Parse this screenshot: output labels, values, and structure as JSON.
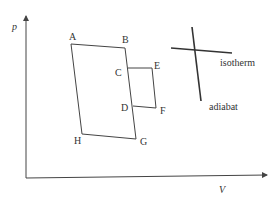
{
  "diagram": {
    "type": "pV-diagram",
    "axes": {
      "y_label": "p",
      "x_label": "V"
    },
    "points": {
      "A": "A",
      "B": "B",
      "C": "C",
      "D": "D",
      "E": "E",
      "F": "F",
      "G": "G",
      "H": "H"
    },
    "legend": {
      "isotherm": "isotherm",
      "adiabat": "adiabat"
    },
    "colors": {
      "line": "#444444",
      "text": "#333333",
      "background": "#ffffff"
    }
  }
}
